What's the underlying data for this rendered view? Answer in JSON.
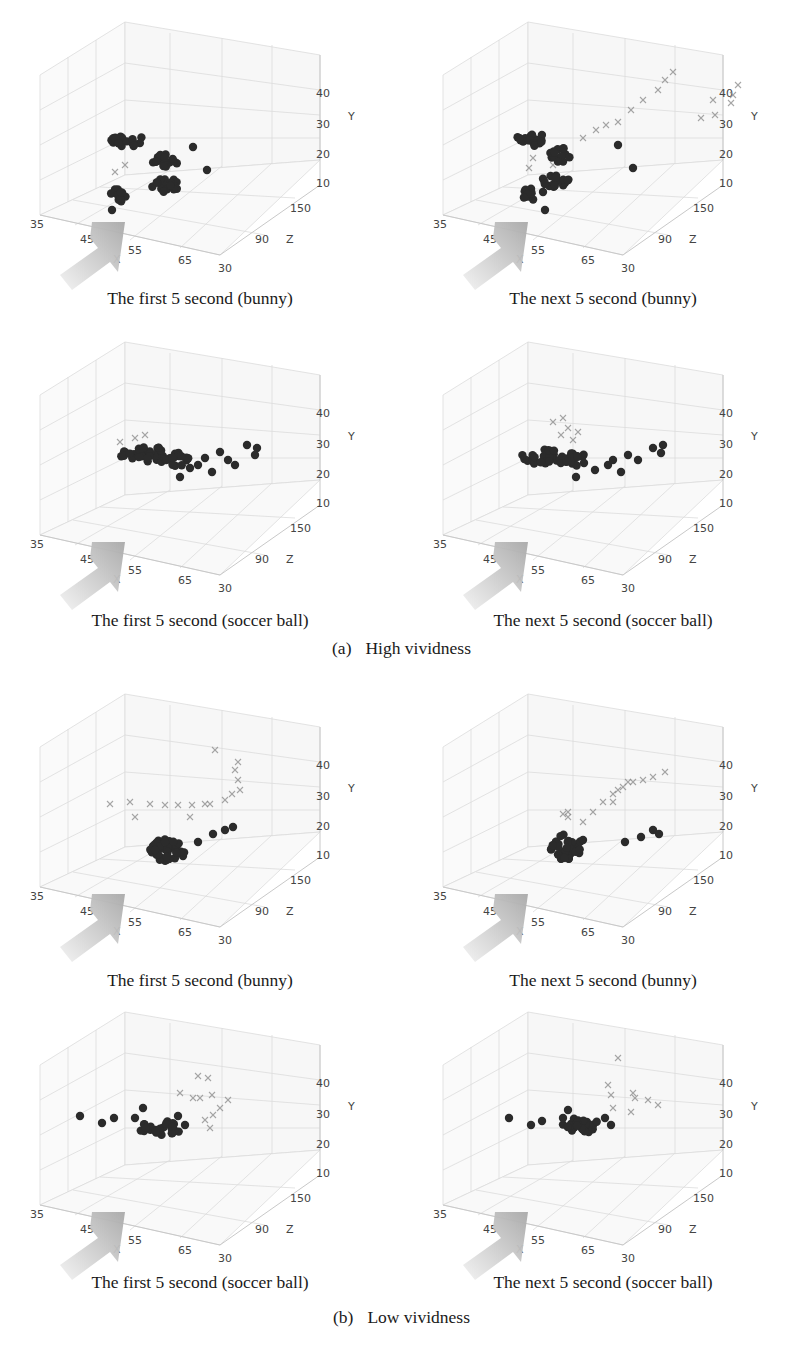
{
  "figure": {
    "groups": [
      {
        "label": "(a)",
        "title": "High vividness",
        "panels": [
          {
            "caption": "The first 5 second (bunny)"
          },
          {
            "caption": "The next 5 second (bunny)"
          },
          {
            "caption": "The first 5 second (soccer ball)"
          },
          {
            "caption": "The next 5 second (soccer ball)"
          }
        ]
      },
      {
        "label": "(b)",
        "title": "Low vividness",
        "panels": [
          {
            "caption": "The first 5 second (bunny)"
          },
          {
            "caption": "The next 5 second (bunny)"
          },
          {
            "caption": "The first 5 second (soccer ball)"
          },
          {
            "caption": "The next 5 second (soccer ball)"
          }
        ]
      }
    ],
    "axes": {
      "x_label": "X",
      "y_label": "Y",
      "z_label": "Z",
      "x_ticks": [
        "35",
        "45",
        "55",
        "65"
      ],
      "y_ticks": [
        "10",
        "20",
        "30",
        "40"
      ],
      "z_ticks": [
        "30",
        "90",
        "150"
      ]
    },
    "colors": {
      "circle_marker": "#2b2b2b",
      "cross_marker": "#8a8a8a",
      "grid": "#d8d8d8",
      "arrow": "#b5b5b5"
    }
  },
  "chart_data": [
    {
      "type": "scatter",
      "title": "The first 5 second (bunny)",
      "group": "(a) High vividness",
      "xlabel": "X",
      "ylabel": "Y",
      "zlabel": "Z",
      "xlim": [
        35,
        65
      ],
      "ylim": [
        10,
        40
      ],
      "zlim": [
        30,
        150
      ],
      "series": [
        {
          "name": "circles",
          "marker": "o",
          "description": "dense cluster around X≈45-55, Y≈15-25 with a lower sub-cluster near X≈45, Y≈12"
        },
        {
          "name": "crosses",
          "marker": "x",
          "description": "few faint crosses near X≈45-50, Y≈18-20"
        }
      ],
      "grid": true,
      "legend": false
    },
    {
      "type": "scatter",
      "title": "The next 5 second (bunny)",
      "group": "(a) High vividness",
      "xlabel": "X",
      "ylabel": "Y",
      "zlabel": "Z",
      "xlim": [
        35,
        65
      ],
      "ylim": [
        10,
        40
      ],
      "zlim": [
        30,
        150
      ],
      "series": [
        {
          "name": "circles",
          "marker": "o",
          "description": "cluster around X≈45-55, Y≈15-25"
        },
        {
          "name": "crosses",
          "marker": "x",
          "description": "diagonal trail rising toward Y≈40 and group near far corner Y≈30-40"
        }
      ],
      "grid": true,
      "legend": false
    },
    {
      "type": "scatter",
      "title": "The first 5 second (soccer ball)",
      "group": "(a) High vividness",
      "xlabel": "X",
      "ylabel": "Y",
      "zlabel": "Z",
      "xlim": [
        35,
        65
      ],
      "ylim": [
        10,
        40
      ],
      "zlim": [
        30,
        150
      ],
      "series": [
        {
          "name": "circles",
          "marker": "o",
          "description": "horizontal band Y≈20-25 from X≈45 extending right to far Z"
        },
        {
          "name": "crosses",
          "marker": "x",
          "description": "faint crosses behind main cluster"
        }
      ],
      "grid": true,
      "legend": false
    },
    {
      "type": "scatter",
      "title": "The next 5 second (soccer ball)",
      "group": "(a) High vividness",
      "xlabel": "X",
      "ylabel": "Y",
      "zlabel": "Z",
      "xlim": [
        35,
        65
      ],
      "ylim": [
        10,
        40
      ],
      "zlim": [
        30,
        150
      ],
      "series": [
        {
          "name": "circles",
          "marker": "o",
          "description": "horizontal band Y≈20-25 extending right"
        },
        {
          "name": "crosses",
          "marker": "x",
          "description": "small group above cluster Y≈25-32"
        }
      ],
      "grid": true,
      "legend": false
    },
    {
      "type": "scatter",
      "title": "The first 5 second (bunny)",
      "group": "(b) Low vividness",
      "xlabel": "X",
      "ylabel": "Y",
      "zlabel": "Z",
      "xlim": [
        35,
        65
      ],
      "ylim": [
        10,
        40
      ],
      "zlim": [
        30,
        150
      ],
      "series": [
        {
          "name": "circles",
          "marker": "o",
          "description": "compact cluster X≈50-55, Y≈18-24 plus a few to the right"
        },
        {
          "name": "crosses",
          "marker": "x",
          "description": "horizontal band Y≈30 and rising group near right Y≈35-42"
        }
      ],
      "grid": true,
      "legend": false
    },
    {
      "type": "scatter",
      "title": "The next 5 second (bunny)",
      "group": "(b) Low vividness",
      "xlabel": "X",
      "ylabel": "Y",
      "zlabel": "Z",
      "xlim": [
        35,
        65
      ],
      "ylim": [
        10,
        40
      ],
      "zlim": [
        30,
        150
      ],
      "series": [
        {
          "name": "circles",
          "marker": "o",
          "description": "compact cluster X≈50-55, Y≈18-24 plus a few to the right"
        },
        {
          "name": "crosses",
          "marker": "x",
          "description": "diagonal line of crosses rising to the right toward Y≈38"
        }
      ],
      "grid": true,
      "legend": false
    },
    {
      "type": "scatter",
      "title": "The first 5 second (soccer ball)",
      "group": "(b) Low vividness",
      "xlabel": "X",
      "ylabel": "Y",
      "zlabel": "Z",
      "xlim": [
        35,
        65
      ],
      "ylim": [
        10,
        40
      ],
      "zlim": [
        30,
        150
      ],
      "series": [
        {
          "name": "circles",
          "marker": "o",
          "description": "cluster X≈50-55, Y≈20-23 with scattered points to the left"
        },
        {
          "name": "crosses",
          "marker": "x",
          "description": "clusters above and to the right Y≈25-35"
        }
      ],
      "grid": true,
      "legend": false
    },
    {
      "type": "scatter",
      "title": "The next 5 second (soccer ball)",
      "group": "(b) Low vividness",
      "xlabel": "X",
      "ylabel": "Y",
      "zlabel": "Z",
      "xlim": [
        35,
        65
      ],
      "ylim": [
        10,
        40
      ],
      "zlim": [
        30,
        150
      ],
      "series": [
        {
          "name": "circles",
          "marker": "o",
          "description": "cluster X≈50-55, Y≈20-23 with scattered points to the left"
        },
        {
          "name": "crosses",
          "marker": "x",
          "description": "several small clusters above-right Y≈25-35"
        }
      ],
      "grid": true,
      "legend": false
    }
  ]
}
